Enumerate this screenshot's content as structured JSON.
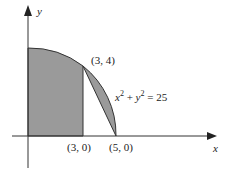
{
  "diagram": {
    "axes": {
      "x_label": "x",
      "y_label": "y"
    },
    "circle_equation": {
      "x": "x",
      "exp1": "2",
      "plus": " + ",
      "y": "y",
      "exp2": "2",
      "rhs": " = 25"
    },
    "points": {
      "p34": "(3, 4)",
      "p30": "(3, 0)",
      "p50": "(5, 0)"
    },
    "colors": {
      "shade": "#9a9a9a",
      "stroke": "#333333"
    }
  }
}
